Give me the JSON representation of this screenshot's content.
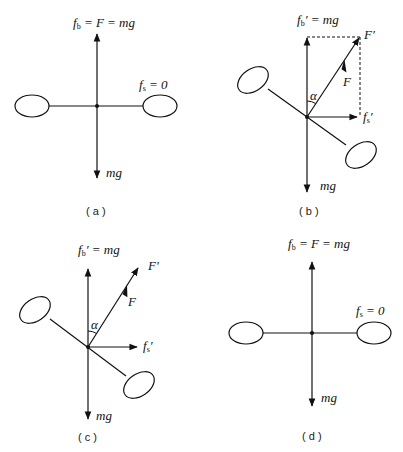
{
  "figure": {
    "panels": [
      {
        "id": "a",
        "caption": "( a )",
        "labels": {
          "top_main": "f",
          "top_sub": "b",
          "top_rest": " = F = mg",
          "right_main": "f",
          "right_sub": "s",
          "right_rest": " = 0",
          "bottom": "mg"
        }
      },
      {
        "id": "b",
        "caption": "( b )",
        "labels": {
          "top_main": "f",
          "top_sub": "b",
          "top_rest": "′ = mg",
          "resultant": "F′",
          "force": "F",
          "angle": "α",
          "side_main": "f",
          "side_sub": "s",
          "side_rest": "′",
          "bottom": "mg"
        }
      },
      {
        "id": "c",
        "caption": "( c )",
        "labels": {
          "top_main": "f",
          "top_sub": "b",
          "top_rest": "′ = mg",
          "resultant": "F′",
          "force": "F",
          "angle": "α",
          "side_main": "f",
          "side_sub": "s",
          "side_rest": "′",
          "bottom": "mg"
        }
      },
      {
        "id": "d",
        "caption": "( d )",
        "labels": {
          "top_main": "f",
          "top_sub": "b",
          "top_rest": " = F = mg",
          "right_main": "f",
          "right_sub": "s",
          "right_rest": " = 0",
          "bottom": "mg"
        }
      }
    ]
  }
}
